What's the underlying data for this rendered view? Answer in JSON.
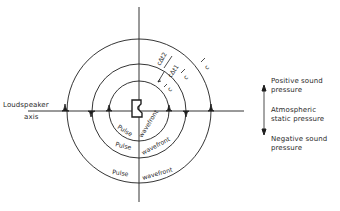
{
  "diagram": {
    "type": "sound pulse wavefronts radiating from a loudspeaker",
    "axis_label": {
      "line1": "Loudspeaker",
      "line2": "axis"
    },
    "wavefront_label": {
      "left": "Pulse",
      "right": "wavefront"
    },
    "dimension_labels": {
      "outer_gap": "cΔt2",
      "middle_gap": "cΔt1",
      "c_outer": "c",
      "c_middle": "c",
      "c_inner": "c"
    },
    "legend": {
      "positive": {
        "line1": "Positive sound",
        "line2": "pressure"
      },
      "static": {
        "line1": "Atmospheric",
        "line2": "static pressure"
      },
      "negative": {
        "line1": "Negative sound",
        "line2": "pressure"
      }
    },
    "colors": {
      "line": "#1e1e1e",
      "background": "#ffffff"
    }
  }
}
